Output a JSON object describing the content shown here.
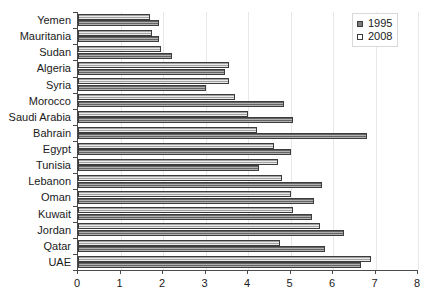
{
  "chart_data": {
    "type": "bar",
    "orientation": "horizontal",
    "title": "",
    "subtitle": "",
    "xlabel": "",
    "ylabel": "",
    "xlim": [
      0,
      8
    ],
    "xticks": [
      "0",
      "1",
      "2",
      "3",
      "4",
      "5",
      "6",
      "7",
      "8"
    ],
    "grid": true,
    "legend_position": "top-right",
    "categories": [
      "Yemen",
      "Mauritania",
      "Sudan",
      "Algeria",
      "Syria",
      "Morocco",
      "Saudi Arabia",
      "Bahrain",
      "Egypt",
      "Tunisia",
      "Lebanon",
      "Oman",
      "Kuwait",
      "Jordan",
      "Qatar",
      "UAE"
    ],
    "series": [
      {
        "name": "1995",
        "color": "#8f8f8f",
        "values": [
          1.9,
          1.9,
          2.2,
          3.45,
          3.0,
          4.85,
          5.05,
          6.8,
          5.0,
          4.25,
          5.75,
          5.55,
          5.5,
          6.25,
          5.8,
          6.65
        ]
      },
      {
        "name": "2008",
        "color": "#d0d0d0",
        "values": [
          1.7,
          1.75,
          1.95,
          3.55,
          3.55,
          3.7,
          4.0,
          4.2,
          4.6,
          4.7,
          4.8,
          5.0,
          5.05,
          5.7,
          4.75,
          6.9
        ]
      }
    ]
  },
  "legend": {
    "entries": [
      {
        "label": "1995",
        "swatch": "legend-swatch-1995"
      },
      {
        "label": "2008",
        "swatch": "legend-swatch-2008"
      }
    ]
  },
  "colors": {
    "series_1995": "#8f8f8f",
    "series_2008": "#d0d0d0",
    "axis": "#4a4a4a",
    "grid": "#e8e8e8",
    "text": "#1a1a1a",
    "background": "#ffffff"
  }
}
